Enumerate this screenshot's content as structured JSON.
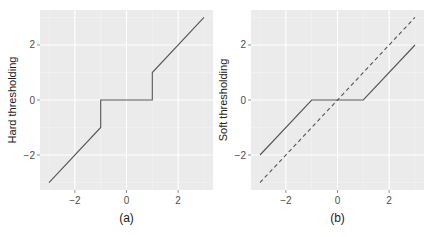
{
  "chart_data": [
    {
      "type": "line",
      "title": "",
      "caption": "(a)",
      "xlabel": "",
      "ylabel": "Hard thresholding",
      "xlim": [
        -3.35,
        3.35
      ],
      "ylim": [
        -3.27,
        3.27
      ],
      "xticks": [
        -2,
        0,
        2
      ],
      "xtick_labels": [
        "−2",
        "0",
        "2"
      ],
      "yticks": [
        -2,
        0,
        2
      ],
      "ytick_labels": [
        "−2",
        "0",
        "2"
      ],
      "grid": true,
      "legend": null,
      "series": [
        {
          "name": "hard",
          "style": "solid",
          "color": "#555555",
          "x": [
            -3,
            -1,
            -1,
            1,
            1,
            3
          ],
          "y": [
            -3,
            -1,
            0,
            0,
            1,
            3
          ]
        }
      ]
    },
    {
      "type": "line",
      "title": "",
      "caption": "(b)",
      "xlabel": "",
      "ylabel": "Soft thresholding",
      "xlim": [
        -3.35,
        3.35
      ],
      "ylim": [
        -3.27,
        3.27
      ],
      "xticks": [
        -2,
        0,
        2
      ],
      "xtick_labels": [
        "−2",
        "0",
        "2"
      ],
      "yticks": [
        -2,
        0,
        2
      ],
      "ytick_labels": [
        "−2",
        "0",
        "2"
      ],
      "grid": true,
      "legend": null,
      "series": [
        {
          "name": "soft",
          "style": "solid",
          "color": "#555555",
          "x": [
            -3,
            -1,
            1,
            3
          ],
          "y": [
            -2,
            0,
            0,
            2
          ]
        },
        {
          "name": "identity",
          "style": "dashed",
          "color": "#555555",
          "x": [
            -3,
            3
          ],
          "y": [
            -3,
            3
          ]
        }
      ]
    }
  ],
  "colors": {
    "panel_bg": "#ebebeb",
    "grid_major": "#ffffff",
    "grid_minor": "#f4f4f4",
    "line": "#555555",
    "tick_text": "#4d4d4d"
  }
}
